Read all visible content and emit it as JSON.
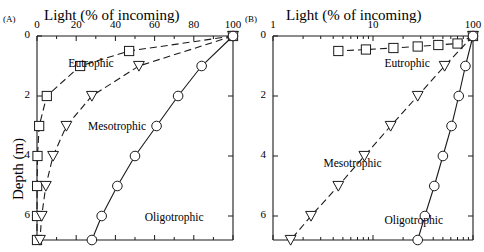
{
  "figure": {
    "panels": [
      {
        "letter": "(A)",
        "xaxis_title": "Light (% of incoming)",
        "xaxis_scale": "linear",
        "xticks": [
          "0",
          "20",
          "40",
          "60",
          "80",
          "100"
        ],
        "xtick_values": [
          0,
          20,
          40,
          60,
          80,
          100
        ],
        "yaxis_title": "Depth (m)",
        "yticks": [
          "0",
          "2",
          "4",
          "6"
        ],
        "ytick_values": [
          0,
          2,
          4,
          6
        ],
        "series_labels": {
          "eutrophic": "Eutrophic",
          "mesotrophic": "Mesotrophic",
          "oligotrophic": "Oligotrophic"
        }
      },
      {
        "letter": "(B)",
        "xaxis_title": "Light (% of incoming)",
        "xaxis_scale": "log",
        "xticks": [
          "1",
          "10",
          "100"
        ],
        "xtick_values": [
          1,
          10,
          100
        ],
        "yaxis_title": "",
        "yticks": [
          "0",
          "2",
          "4",
          "6"
        ],
        "ytick_values": [
          0,
          2,
          4,
          6
        ],
        "series_labels": {
          "eutrophic": "Eutrophic",
          "mesotrophic": "Mesotrophic",
          "oligotrophic": "Oligotrophic"
        }
      }
    ]
  },
  "chart_data": {
    "type": "line",
    "title": "",
    "xlabel": "Light (% of incoming)",
    "ylabel": "Depth (m)",
    "grid": false,
    "legend": "inline-annotations",
    "panels": [
      {
        "panel": "A",
        "xscale": "linear",
        "xlim": [
          0,
          100
        ],
        "ylim": [
          6.8,
          0
        ],
        "xticks": [
          0,
          20,
          40,
          60,
          80,
          100
        ],
        "yticks": [
          0,
          2,
          4,
          6
        ],
        "series": [
          {
            "name": "Eutrophic",
            "marker": "square",
            "linestyle": "dashed",
            "depths_m": [
              0,
              0.5,
              1,
              2,
              3,
              4,
              5,
              6,
              6.8
            ],
            "light_percent": [
              100,
              47,
              22,
              5,
              1.1,
              0.25,
              0.06,
              0.012,
              0.004
            ]
          },
          {
            "name": "Mesotrophic",
            "marker": "triangle-down",
            "linestyle": "dashed",
            "depths_m": [
              0,
              1,
              2,
              3,
              4,
              5,
              6,
              6.8
            ],
            "light_percent": [
              100,
              52,
              28,
              15,
              8.2,
              4.5,
              2.4,
              1.5
            ]
          },
          {
            "name": "Oligotrophic",
            "marker": "circle",
            "linestyle": "solid",
            "depths_m": [
              0,
              1,
              2,
              3,
              4,
              5,
              6,
              6.8
            ],
            "light_percent": [
              100,
              84,
              72,
              61,
              50,
              41,
              33,
              28
            ]
          }
        ],
        "annotations": [
          {
            "text": "Eutrophic",
            "x_percent": 16,
            "depth_m": 0.95
          },
          {
            "text": "Mesotrophic",
            "x_percent": 26,
            "depth_m": 3.05
          },
          {
            "text": "Oligotrophic",
            "x_percent": 55,
            "depth_m": 6.1
          }
        ]
      },
      {
        "panel": "B",
        "xscale": "log",
        "xlim": [
          0.6,
          130
        ],
        "ylim": [
          6.8,
          0
        ],
        "xticks": [
          1,
          10,
          100
        ],
        "yticks": [
          0,
          2,
          4,
          6
        ],
        "series": [
          {
            "name": "Eutrophic",
            "marker": "square",
            "linestyle": "dashed",
            "depths_m": [
              0,
              0.25,
              0.3,
              0.35,
              0.4,
              0.45,
              0.5
            ],
            "light_percent": [
              100,
              70,
              45,
              28,
              16,
              8.5,
              4.5
            ]
          },
          {
            "name": "Mesotrophic",
            "marker": "triangle-down",
            "linestyle": "dashed",
            "depths_m": [
              0,
              1,
              2,
              3,
              4,
              5,
              6,
              6.8
            ],
            "light_percent": [
              100,
              52,
              28,
              15,
              8.2,
              4.5,
              2.4,
              1.5
            ]
          },
          {
            "name": "Oligotrophic",
            "marker": "circle",
            "linestyle": "solid",
            "depths_m": [
              0,
              1,
              2,
              3,
              4,
              5,
              6,
              6.8
            ],
            "light_percent": [
              100,
              84,
              72,
              61,
              50,
              41,
              33,
              28
            ]
          }
        ],
        "annotations": [
          {
            "text": "Eutrophic",
            "x_percent": 13,
            "depth_m": 0.95
          },
          {
            "text": "Mesotrophic",
            "x_percent": 3.2,
            "depth_m": 4.3
          },
          {
            "text": "Oligotrophic",
            "x_percent": 13,
            "depth_m": 6.2
          }
        ]
      }
    ]
  },
  "style": {
    "axis_color": "#1a1a1a",
    "line_color": "#1a1a1a",
    "background": "#ffffff"
  }
}
